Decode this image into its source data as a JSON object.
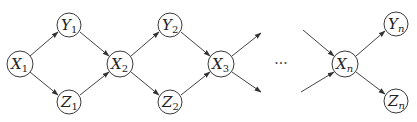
{
  "diagram": {
    "type": "directed-graph",
    "nodes": [
      {
        "id": "X1",
        "var": "X",
        "sub": "1",
        "cx": 20,
        "cy": 64,
        "r": 13
      },
      {
        "id": "Y1",
        "var": "Y",
        "sub": "1",
        "cx": 69,
        "cy": 25,
        "r": 12
      },
      {
        "id": "Z1",
        "var": "Z",
        "sub": "1",
        "cx": 69,
        "cy": 102,
        "r": 12
      },
      {
        "id": "X2",
        "var": "X",
        "sub": "2",
        "cx": 120,
        "cy": 64,
        "r": 13
      },
      {
        "id": "Y2",
        "var": "Y",
        "sub": "2",
        "cx": 170,
        "cy": 25,
        "r": 12
      },
      {
        "id": "Z2",
        "var": "Z",
        "sub": "2",
        "cx": 170,
        "cy": 102,
        "r": 12
      },
      {
        "id": "X3",
        "var": "X",
        "sub": "3",
        "cx": 221,
        "cy": 64,
        "r": 13
      },
      {
        "id": "Xn",
        "var": "X",
        "sub": "n",
        "cx": 345,
        "cy": 64,
        "r": 13
      },
      {
        "id": "Yn",
        "var": "Y",
        "sub": "n",
        "cx": 396,
        "cy": 24,
        "r": 12
      },
      {
        "id": "Zn",
        "var": "Z",
        "sub": "n",
        "cx": 396,
        "cy": 101,
        "r": 12
      }
    ],
    "edges": [
      {
        "from": "X1",
        "to": "Y1"
      },
      {
        "from": "X1",
        "to": "Z1"
      },
      {
        "from": "Y1",
        "to": "X2"
      },
      {
        "from": "Z1",
        "to": "X2"
      },
      {
        "from": "X2",
        "to": "Y2"
      },
      {
        "from": "X2",
        "to": "Z2"
      },
      {
        "from": "Y2",
        "to": "X3"
      },
      {
        "from": "Z2",
        "to": "X3"
      },
      {
        "from": "X3",
        "to": "open-upper"
      },
      {
        "from": "X3",
        "to": "open-lower"
      },
      {
        "from": "open-upper-in",
        "to": "Xn"
      },
      {
        "from": "open-lower-in",
        "to": "Xn"
      },
      {
        "from": "Xn",
        "to": "Yn"
      },
      {
        "from": "Xn",
        "to": "Zn"
      }
    ],
    "ellipsis": "···"
  }
}
